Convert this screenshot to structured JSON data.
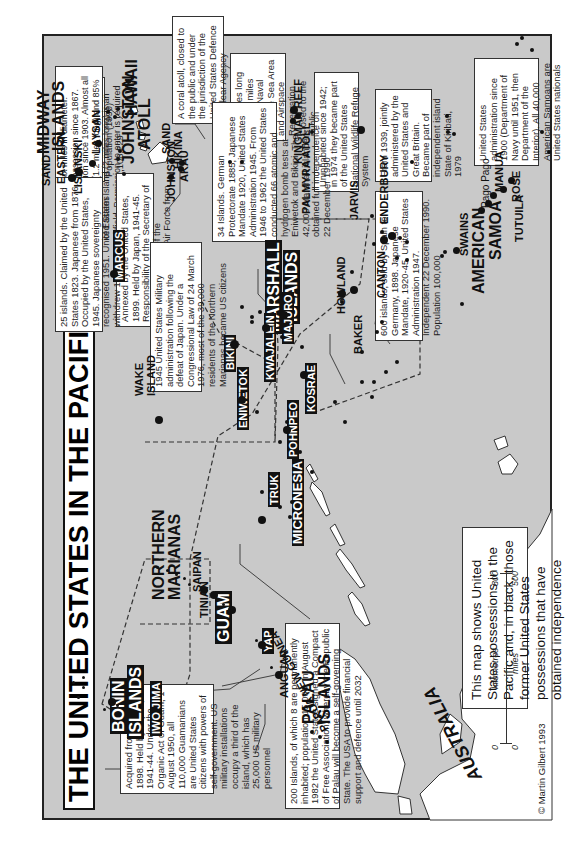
{
  "title": "THE UNITED STATES IN THE PACIFIC, 1823-1993",
  "credit": "© Martin Gilbert 1993",
  "legend_note": "This map shows United States possessions in the Pacific and, in black, those former United States possessions that have obtained independence",
  "scale": {
    "km_label": "kilometres",
    "miles_label": "miles",
    "km_zero": "0",
    "km_max": "800",
    "miles_zero": "0",
    "miles_max": "500"
  },
  "labels": {
    "hawaii": "HAWAII",
    "midway": "MIDWAY",
    "midway_islands": "ISLANDS",
    "sand_midway": "SAND",
    "eastern": "EASTERN",
    "lisianski": "LISIANSKI",
    "laysan": "LAYSAN",
    "johnston_atoll_1": "JOHNSTON",
    "johnston_atoll_2": "ATOLL",
    "johnston": "JOHNSTON",
    "sand_johnston": "SAND",
    "hikina": "HIKINA",
    "akau": "AKAU",
    "kingman_reef": "KINGMAN REEF",
    "palmyra_atoll": "PALMYRA ATOLL",
    "jarvis": "JARVIS",
    "howland": "HOWLAND",
    "baker": "BAKER",
    "canton": "CANTON",
    "enderbury": "ENDERBURY",
    "swains": "SWAINS",
    "american": "AMERICAN",
    "samoa": "SAMOA",
    "tutuila": "TUTUILA",
    "pago_pago": "Pago Pago",
    "manua": "MANUA",
    "rose": "ROSE",
    "wake_1": "WAKE",
    "wake_2": "ISLAND",
    "marshall_1": "MARSHALL",
    "marshall_2": "ISLANDS",
    "bikini": "BIKINI",
    "eniwetok": "ENIWETOK",
    "kwajalein": "KWAJALEIN",
    "majuro": "MAJURO",
    "kosrae": "KOSRAE",
    "pohnpeo": "POHNPEO",
    "micronesia": "MICRONESIA",
    "truk": "TRUK",
    "marcus": "MARCUS",
    "northern": "NORTHERN",
    "marianas": "MARIANAS",
    "saipan": "SAIPAN",
    "tinian": "TINIAN",
    "guam": "GUAM",
    "yap": "YAP",
    "anguar": "ANGUAR",
    "palau_1": "PALAU",
    "palau_2": "ISLANDS",
    "bonin_1": "BONIN",
    "bonin_2": "ISLANDS",
    "iwo_jima": "IWO JIMA",
    "papua_new_guinea": "PAPUA NEW GUINEA",
    "australia": "AUSTRALIA"
  },
  "notes": {
    "hawaii": "Annexed by the United States 1823. Became the 50th State of the Union, 1959. Population (1990) 1,108,229",
    "johnston": "A coral atoll, closed to the public and under the jurisdiction of the United States Defence Nuclear Agency",
    "kingman": "Nine miles long and five miles wide. A Naval Defence Sea Area and Airspace Reservation. Closed to the public",
    "jarvis": "Uninhabited since 1942; in 1974 they became part of the United States National Wildlife Refuge System",
    "canton": "From 1939, jointly administered by the United States and Great Britain. Became part of independent island State of Kiribati, 1979",
    "samoa": "United States administration since 1900 (Department of Navy until 1951, then Department of the Interior). All 40,000 American Samoans are United States nationals",
    "midway": "A circular atoll six miles in diameter. United States possession since 1867. Naval Reservation since 1903. Almost all of Sand Island (1.2 miles long) and 85% of Eastern Island (2 miles long) is an airfield. Permission to enter is required",
    "wake": "Annexed by the United States, 1899. Held by Japan, 1941-45. Responsibility of the Secretary of the Interior, 1962; of the Department of the Air Force from 1972",
    "marshall": "34 Islands. German Protectorate 1885, Japanese Mandate 1920, United States Administration 1945. From 1946 to 1962 the United States conducted 66 atomic and hydrogen bomb tests at Eniwetok and Bikini. The 42,000 Marshall islanders obtained full independence on 22 December 1990",
    "marianas": "1945 United States Military administration following the defeat of Japan. Under a Congressional Law of 24 March 1976, most of the 39,000 residents of the Northern Marianas became US citizens",
    "micronesia": "600 islands, sold by Spain to Germany, 1898. Japanese Mandate, 1920-45. United States Administration 1947. Independent 22 December 1990. Population 100,000",
    "marcus": "25 islands. Claimed by the United States 1823. Japanese from 1876. Occupied by the United States, 1945. Japanese sovereignty recognised 1951. United States withdrew 1968",
    "guam": "Acquired from Spain, 1898. Held by Japan, 1941-44. Under the Organic Act of Guam, 1 August 1950, all 110,000 Guamanians are United States citizens with powers of self-government. US military installations occupy a third of the island, which has 25,000 US military personnel",
    "palau": "200 Islands, of which 8 are permanently inhabited; population 15,000. In August 1982 the United States signed a Compact of Free Association, whereby the Republic of Palau will become a self-governing State. The USA to provide financial support and defence until 2032"
  },
  "colors": {
    "ocean": "#c9c9c9",
    "land": "#ffffff",
    "ink": "#111111"
  }
}
